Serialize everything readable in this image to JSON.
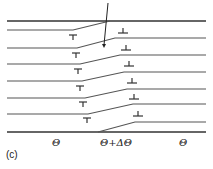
{
  "figure": {
    "panel_label": "(c)",
    "labels": {
      "left_region": "Θ",
      "middle_region": "Θ+ΔΘ",
      "right_region": "Θ"
    },
    "colors": {
      "line": "#555555",
      "boundary": "#333333",
      "text": "#222222"
    },
    "top_line_y": 21,
    "bottom_line_y": 132,
    "planes": [
      {
        "left_y": 30,
        "bend_left_x": 73,
        "bend_right_x": 110,
        "right_y": 21
      },
      {
        "left_y": 48,
        "bend_left_x": 77,
        "bend_right_x": 115,
        "right_y": 38
      },
      {
        "left_y": 64,
        "bend_left_x": 80,
        "bend_right_x": 120,
        "right_y": 55
      },
      {
        "left_y": 81,
        "bend_left_x": 82,
        "bend_right_x": 124,
        "right_y": 72
      },
      {
        "left_y": 98,
        "bend_left_x": 85,
        "bend_right_x": 127,
        "right_y": 89
      },
      {
        "left_y": 114,
        "bend_left_x": 88,
        "bend_right_x": 133,
        "right_y": 104
      },
      {
        "left_y": 132,
        "bend_left_x": 98,
        "bend_right_x": 135,
        "right_y": 122
      }
    ],
    "left_dislocations": [
      {
        "x": 73,
        "y": 35
      },
      {
        "x": 76,
        "y": 53
      },
      {
        "x": 78,
        "y": 69
      },
      {
        "x": 80,
        "y": 86
      },
      {
        "x": 83,
        "y": 102
      },
      {
        "x": 87,
        "y": 118
      }
    ],
    "right_dislocations": [
      {
        "x": 123,
        "y": 33
      },
      {
        "x": 126,
        "y": 50
      },
      {
        "x": 129,
        "y": 66
      },
      {
        "x": 132,
        "y": 83
      },
      {
        "x": 134,
        "y": 99
      },
      {
        "x": 138,
        "y": 116
      }
    ],
    "arrow": {
      "x1": 108,
      "y1": 3,
      "x2": 104,
      "y2": 48
    }
  }
}
